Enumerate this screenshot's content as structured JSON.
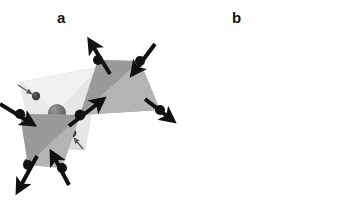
{
  "figure": {
    "background_color": "#ffffff",
    "width": 348,
    "height": 201,
    "caption_style": "bold lowercase letters"
  },
  "panels": [
    {
      "id": "a",
      "label": "a",
      "label_x": 62,
      "label_y": 18,
      "description": "single tetrahedron with central cation and four displaced ligand spheres",
      "polyhedron": {
        "face_light_color": "#efefef",
        "face_mid_color": "#e3e3e3",
        "face_dark_color": "#d8d8d8",
        "edge_color": "#c8c8c8",
        "vertices_px": [
          {
            "name": "top-left",
            "x": 20,
            "y": 82
          },
          {
            "name": "top-right",
            "x": 100,
            "y": 67
          },
          {
            "name": "bottom-left",
            "x": 33,
            "y": 147
          },
          {
            "name": "bottom-right",
            "x": 85,
            "y": 150
          }
        ]
      },
      "center_sphere": {
        "name": "central-atom",
        "x": 57,
        "y": 113,
        "r": 9,
        "fill": "#6e6e6e",
        "highlight": "#9a9a9a"
      },
      "ligands": [
        {
          "name": "ligand-top-left",
          "x": 36,
          "y": 96,
          "r": 4.2,
          "fill": "#3d3d3d"
        },
        {
          "name": "ligand-top-right",
          "x": 113,
          "y": 66,
          "r": 4.6,
          "fill": "#3d3d3d"
        },
        {
          "name": "ligand-bottom-left",
          "x": 28,
          "y": 163,
          "r": 4.6,
          "fill": "#3d3d3d"
        },
        {
          "name": "ligand-bottom-right",
          "x": 72,
          "y": 133,
          "r": 4.4,
          "fill": "#3d3d3d"
        }
      ],
      "arrows": [
        {
          "name": "arrow-top-left-inward",
          "x1": 18,
          "y1": 85,
          "x2": 33,
          "y2": 95,
          "color": "#555555",
          "width": 1.2
        },
        {
          "name": "arrow-top-right-outward",
          "x1": 96,
          "y1": 84,
          "x2": 109,
          "y2": 70,
          "color": "#555555",
          "width": 1.2
        },
        {
          "name": "arrow-bottom-left-outward",
          "x1": 41,
          "y1": 148,
          "x2": 31,
          "y2": 159,
          "color": "#555555",
          "width": 1.2
        },
        {
          "name": "arrow-bottom-right-inward",
          "x1": 83,
          "y1": 149,
          "x2": 74,
          "y2": 137,
          "color": "#555555",
          "width": 1.2
        }
      ]
    },
    {
      "id": "b",
      "label": "b",
      "label_x": 232,
      "label_y": 20,
      "description": "two corner-sharing tetrahedra with bold displacement arrows at each vertex",
      "upper_tetrahedron": {
        "face_light_color": "#b2b2b2",
        "face_dark_color": "#989898",
        "vertices_px": [
          {
            "name": "upper-top-left",
            "x": 258,
            "y": 60
          },
          {
            "name": "upper-top-right",
            "x": 300,
            "y": 61
          },
          {
            "name": "upper-bottom-right",
            "x": 320,
            "y": 110
          },
          {
            "name": "upper-shared",
            "x": 240,
            "y": 115
          }
        ]
      },
      "lower_tetrahedron": {
        "face_light_color": "#b2b2b2",
        "face_dark_color": "#989898",
        "vertices_px": [
          {
            "name": "lower-top-left",
            "x": 180,
            "y": 114
          },
          {
            "name": "lower-shared",
            "x": 240,
            "y": 115
          },
          {
            "name": "lower-bottom-right",
            "x": 222,
            "y": 168
          },
          {
            "name": "lower-bottom-left",
            "x": 188,
            "y": 165
          }
        ]
      },
      "nodes": [
        {
          "name": "node-upper-top-left",
          "x": 258,
          "y": 60,
          "r": 5.0,
          "fill": "#111111"
        },
        {
          "name": "node-upper-top-right",
          "x": 300,
          "y": 61,
          "r": 5.0,
          "fill": "#111111"
        },
        {
          "name": "node-upper-bottom-right",
          "x": 320,
          "y": 110,
          "r": 5.0,
          "fill": "#111111"
        },
        {
          "name": "node-shared-corner",
          "x": 240,
          "y": 115,
          "r": 5.4,
          "fill": "#111111"
        },
        {
          "name": "node-lower-top-left",
          "x": 180,
          "y": 114,
          "r": 5.0,
          "fill": "#111111"
        },
        {
          "name": "node-lower-bottom-right",
          "x": 222,
          "y": 168,
          "r": 5.0,
          "fill": "#111111"
        },
        {
          "name": "node-lower-bottom-left",
          "x": 188,
          "y": 165,
          "r": 5.0,
          "fill": "#111111"
        }
      ],
      "arrows": [
        {
          "name": "arrow-upper-top-left-out",
          "x1": 270,
          "y1": 73,
          "x2": 250,
          "y2": 41,
          "color": "#111111",
          "width": 4.0
        },
        {
          "name": "arrow-upper-top-right-in",
          "x1": 315,
          "y1": 43,
          "x2": 293,
          "y2": 73,
          "color": "#111111",
          "width": 4.0
        },
        {
          "name": "arrow-upper-right-out",
          "x1": 304,
          "y1": 98,
          "x2": 332,
          "y2": 120,
          "color": "#111111",
          "width": 4.0
        },
        {
          "name": "arrow-shared-out",
          "x1": 228,
          "y1": 127,
          "x2": 262,
          "y2": 100,
          "color": "#111111",
          "width": 4.0
        },
        {
          "name": "arrow-lower-left-in",
          "x1": 159,
          "y1": 104,
          "x2": 192,
          "y2": 124,
          "color": "#111111",
          "width": 4.0
        },
        {
          "name": "arrow-lower-bottom-right-in",
          "x1": 230,
          "y1": 186,
          "x2": 212,
          "y2": 154,
          "color": "#111111",
          "width": 4.0
        },
        {
          "name": "arrow-lower-bottom-left-out",
          "x1": 198,
          "y1": 155,
          "x2": 178,
          "y2": 190,
          "color": "#111111",
          "width": 4.0
        }
      ]
    }
  ]
}
